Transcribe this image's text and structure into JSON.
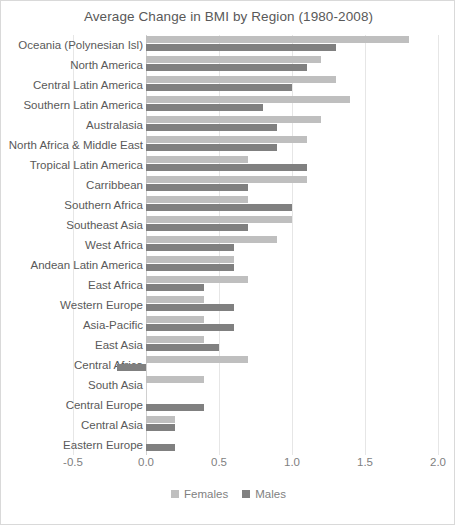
{
  "chart_data": {
    "type": "bar",
    "orientation": "horizontal",
    "title": "Average Change in BMI by Region (1980-2008)",
    "xlabel": "",
    "ylabel": "",
    "xlim": [
      -0.5,
      2.0
    ],
    "xticks": [
      -0.5,
      0.0,
      0.5,
      1.0,
      1.5,
      2.0
    ],
    "xtick_labels": [
      "-0.5",
      "0.0",
      "0.5",
      "1.0",
      "1.5",
      "2.0"
    ],
    "grid": true,
    "grid_axis": "x",
    "legend_position": "bottom",
    "categories": [
      "Oceania (Polynesian Isl)",
      "North America",
      "Central Latin America",
      "Southern Latin America",
      "Australasia",
      "North Africa & Middle East",
      "Tropical Latin America",
      "Carribbean",
      "Southern Africa",
      "Southeast Asia",
      "West Africa",
      "Andean Latin America",
      "East Africa",
      "Western Europe",
      "Asia-Pacific",
      "East Asia",
      "Central Africa",
      "South Asia",
      "Central Europe",
      "Central Asia",
      "Eastern Europe"
    ],
    "series": [
      {
        "name": "Females",
        "color": "#bfbfbf",
        "values": [
          1.8,
          1.2,
          1.3,
          1.4,
          1.2,
          1.1,
          0.7,
          1.1,
          0.7,
          1.0,
          0.9,
          0.6,
          0.7,
          0.4,
          0.4,
          0.4,
          0.7,
          0.4,
          0.0,
          0.2,
          0.0
        ]
      },
      {
        "name": "Males",
        "color": "#808080",
        "values": [
          1.3,
          1.1,
          1.0,
          0.8,
          0.9,
          0.9,
          1.1,
          0.7,
          1.0,
          0.7,
          0.6,
          0.6,
          0.4,
          0.6,
          0.6,
          0.5,
          -0.2,
          0.0,
          0.4,
          0.2,
          0.2
        ]
      }
    ]
  },
  "legend": {
    "items": [
      {
        "label": "Females",
        "color": "#bfbfbf"
      },
      {
        "label": "Males",
        "color": "#808080"
      }
    ]
  }
}
